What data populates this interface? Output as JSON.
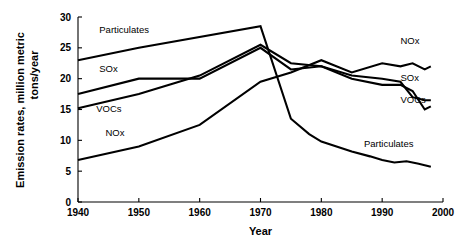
{
  "chart_data": {
    "type": "line",
    "title": "",
    "xlabel": "Year",
    "ylabel": "Emission rates, million metric tons/year",
    "ylabel_line1": "Emission rates, million metric",
    "ylabel_line2": "tons/year",
    "xlim": [
      1940,
      2000
    ],
    "ylim": [
      0,
      30
    ],
    "xticks": [
      1940,
      1950,
      1960,
      1970,
      1980,
      1990,
      2000
    ],
    "yticks": [
      0,
      5,
      10,
      15,
      20,
      25,
      30
    ],
    "xtick_labels": [
      "1940",
      "1950",
      "1960",
      "1970",
      "1980",
      "1990",
      "2000"
    ],
    "ytick_labels": [
      "0",
      "5",
      "10",
      "15",
      "20",
      "25",
      "30"
    ],
    "grid": false,
    "legend": "inline-labels",
    "series": [
      {
        "name": "Particulates",
        "label_left": "Particulates",
        "label_right": "Particulates",
        "x": [
          1940,
          1950,
          1970,
          1975,
          1978,
          1980,
          1985,
          1988,
          1990,
          1992,
          1994,
          1996,
          1998
        ],
        "values": [
          23.0,
          25.0,
          28.5,
          13.5,
          11.0,
          9.8,
          8.2,
          7.4,
          6.8,
          6.4,
          6.6,
          6.2,
          5.7
        ]
      },
      {
        "name": "SOx",
        "label_left": "SOx",
        "label_right": "SOx",
        "x": [
          1940,
          1950,
          1960,
          1970,
          1975,
          1980,
          1985,
          1990,
          1993,
          1995,
          1997,
          1998
        ],
        "values": [
          17.5,
          20.0,
          20.0,
          25.0,
          21.5,
          22.0,
          20.5,
          20.0,
          19.5,
          17.0,
          16.5,
          16.5
        ]
      },
      {
        "name": "VOCs",
        "label_left": "VOCs",
        "label_right": "VOCs",
        "x": [
          1940,
          1950,
          1960,
          1970,
          1975,
          1980,
          1985,
          1990,
          1993,
          1995,
          1997,
          1998
        ],
        "values": [
          15.2,
          17.5,
          20.5,
          25.5,
          22.5,
          22.0,
          20.0,
          19.0,
          19.0,
          18.0,
          15.0,
          15.5
        ]
      },
      {
        "name": "NOx",
        "label_left": "NOx",
        "label_right": "NOx",
        "x": [
          1940,
          1950,
          1960,
          1970,
          1975,
          1980,
          1985,
          1990,
          1993,
          1995,
          1997,
          1998
        ],
        "values": [
          6.8,
          9.0,
          12.5,
          19.5,
          21.0,
          23.0,
          21.0,
          22.5,
          22.0,
          22.5,
          21.5,
          22.0
        ]
      }
    ],
    "inline_labels_left": [
      {
        "text": "Particulates",
        "x": 1943.5,
        "y": 27.4
      },
      {
        "text": "SOx",
        "x": 1943.5,
        "y": 21.1
      },
      {
        "text": "VOCs",
        "x": 1943.0,
        "y": 14.6
      },
      {
        "text": "NOx",
        "x": 1944.5,
        "y": 10.7
      }
    ],
    "inline_labels_right": [
      {
        "text": "NOx",
        "x": 1993.0,
        "y": 25.7
      },
      {
        "text": "SOx",
        "x": 1993.0,
        "y": 19.6
      },
      {
        "text": "VOCs",
        "x": 1993.0,
        "y": 16.0
      },
      {
        "text": "Particulates",
        "x": 1987.0,
        "y": 8.9
      }
    ]
  }
}
